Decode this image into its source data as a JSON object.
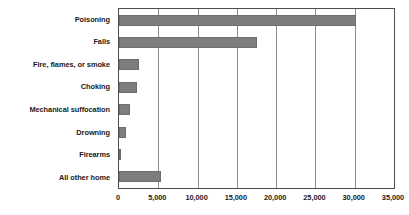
{
  "chart_data": {
    "type": "bar",
    "orientation": "horizontal",
    "title": "",
    "xlabel": "",
    "ylabel": "",
    "xlim": [
      0,
      35000
    ],
    "ylim": null,
    "grid": true,
    "legend": null,
    "categories": [
      "Poisoning",
      "Falls",
      "Fire, flames, or smoke",
      "Choking",
      "Mechanical suffocation",
      "Drowning",
      "Firearms",
      "All other home"
    ],
    "values": [
      30200,
      17600,
      2550,
      2300,
      1450,
      950,
      300,
      5300
    ],
    "xticks": [
      0,
      5000,
      10000,
      15000,
      20000,
      25000,
      30000,
      35000
    ],
    "xtick_labels": [
      "0",
      "5,000",
      "10,000",
      "15,000",
      "20,000",
      "25,000",
      "30,000",
      "35,000"
    ],
    "bar_color": "#7d7d7d",
    "gridline_color": "#8c8c8c",
    "axis_color": "#4d4d4d",
    "background_color": "#ffffff"
  }
}
